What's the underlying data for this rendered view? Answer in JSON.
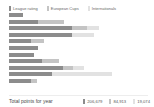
{
  "legend": {
    "items": [
      {
        "label": "League rating",
        "color": "#8c8c8c",
        "key": "league_rating"
      },
      {
        "label": "European Cups",
        "color": "#c4c4c4",
        "key": "european_cups"
      },
      {
        "label": "Internationals",
        "color": "#e2e2e2",
        "key": "internationals"
      }
    ]
  },
  "footer": {
    "label": "Total points for year",
    "totals": [
      {
        "value": "206,679",
        "color": "#8c8c8c"
      },
      {
        "value": "84,913",
        "color": "#c4c4c4"
      },
      {
        "value": "19,074",
        "color": "#e2e2e2"
      }
    ]
  },
  "chart_data": {
    "type": "bar",
    "orientation": "horizontal",
    "stacked": true,
    "title": "",
    "xlabel": "",
    "ylabel": "",
    "grid": false,
    "legend_position": "top-left",
    "categories": [
      "1",
      "2",
      "3",
      "4",
      "5",
      "6",
      "7",
      "8",
      "9",
      "10",
      "11"
    ],
    "series": [
      {
        "name": "League rating",
        "color": "#8c8c8c",
        "values": [
          14,
          29,
          63,
          63,
          22,
          29,
          25,
          33,
          54,
          43,
          22
        ]
      },
      {
        "name": "European Cups",
        "color": "#c4c4c4",
        "values": [
          0,
          26,
          15,
          0,
          13,
          0,
          0,
          17,
          10,
          0,
          6
        ]
      },
      {
        "name": "Internationals",
        "color": "#e2e2e2",
        "values": [
          0,
          0,
          12,
          22,
          0,
          0,
          0,
          0,
          11,
          60,
          0
        ]
      }
    ],
    "xlim": [
      0,
      140
    ],
    "units": "points"
  }
}
